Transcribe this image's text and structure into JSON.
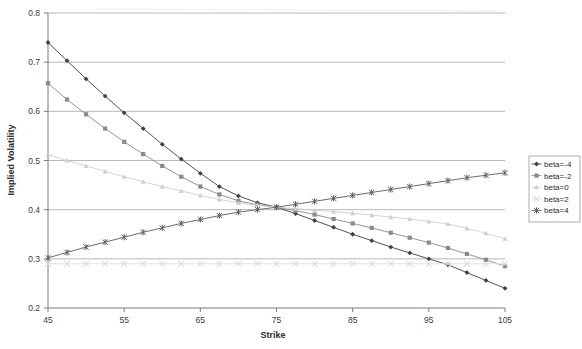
{
  "chart_data": {
    "type": "line",
    "title": "",
    "xlabel": "Strike",
    "ylabel": "Implied Volatility",
    "xlim": [
      45,
      105
    ],
    "ylim": [
      0.2,
      0.8
    ],
    "xticks": [
      45,
      55,
      65,
      75,
      85,
      95,
      105
    ],
    "yticks": [
      0.2,
      0.3,
      0.4,
      0.5,
      0.6,
      0.7,
      0.8
    ],
    "xtick_labels": [
      "45",
      "55",
      "65",
      "75",
      "85",
      "95",
      "105"
    ],
    "ytick_labels": [
      "0.2",
      "0.3",
      "0.4",
      "0.5",
      "0.6",
      "0.7",
      "0.8"
    ],
    "grid": "horizontal",
    "legend_position": "right",
    "x": [
      45,
      47.5,
      50,
      52.5,
      55,
      57.5,
      60,
      62.5,
      65,
      67.5,
      70,
      72.5,
      75,
      77.5,
      80,
      82.5,
      85,
      87.5,
      90,
      92.5,
      95,
      97.5,
      100,
      102.5,
      105
    ],
    "series": [
      {
        "name": "beta=-4",
        "color": "#404040",
        "marker": "diamond",
        "values": [
          0.74,
          0.703,
          0.666,
          0.631,
          0.597,
          0.565,
          0.533,
          0.503,
          0.474,
          0.447,
          0.428,
          0.414,
          0.405,
          0.392,
          0.378,
          0.364,
          0.35,
          0.337,
          0.324,
          0.312,
          0.3,
          0.288,
          0.272,
          0.256,
          0.24
        ]
      },
      {
        "name": "beta=-2",
        "color": "#8a8a8a",
        "marker": "square",
        "values": [
          0.657,
          0.624,
          0.594,
          0.565,
          0.538,
          0.513,
          0.489,
          0.467,
          0.447,
          0.431,
          0.418,
          0.41,
          0.405,
          0.398,
          0.39,
          0.381,
          0.372,
          0.363,
          0.353,
          0.343,
          0.333,
          0.322,
          0.31,
          0.298,
          0.285
        ]
      },
      {
        "name": "beta=0",
        "color": "#cfcfcf",
        "marker": "triangle",
        "values": [
          0.512,
          0.5,
          0.489,
          0.478,
          0.467,
          0.457,
          0.447,
          0.438,
          0.429,
          0.421,
          0.414,
          0.409,
          0.405,
          0.402,
          0.399,
          0.396,
          0.393,
          0.389,
          0.385,
          0.381,
          0.376,
          0.371,
          0.362,
          0.352,
          0.341
        ]
      },
      {
        "name": "beta=2",
        "color": "#dcdcdc",
        "marker": "x",
        "values": [
          0.29,
          0.29,
          0.29,
          0.29,
          0.29,
          0.29,
          0.29,
          0.29,
          0.29,
          0.29,
          0.29,
          0.29,
          0.29,
          0.29,
          0.29,
          0.29,
          0.29,
          0.29,
          0.29,
          0.29,
          0.29,
          0.29,
          0.29,
          0.29,
          0.29
        ]
      },
      {
        "name": "beta=4",
        "color": "#5a5a5a",
        "marker": "asterisk",
        "values": [
          0.302,
          0.313,
          0.324,
          0.334,
          0.344,
          0.354,
          0.363,
          0.372,
          0.38,
          0.388,
          0.395,
          0.4,
          0.405,
          0.411,
          0.417,
          0.423,
          0.429,
          0.435,
          0.441,
          0.447,
          0.453,
          0.459,
          0.465,
          0.47,
          0.475
        ]
      }
    ]
  },
  "legend": {
    "items": [
      {
        "label": "beta=-4"
      },
      {
        "label": "beta=-2"
      },
      {
        "label": "beta=0"
      },
      {
        "label": "beta=2"
      },
      {
        "label": "beta=4"
      }
    ]
  },
  "axes": {
    "x_title": "Strike",
    "y_title": "Implied Volatility"
  }
}
